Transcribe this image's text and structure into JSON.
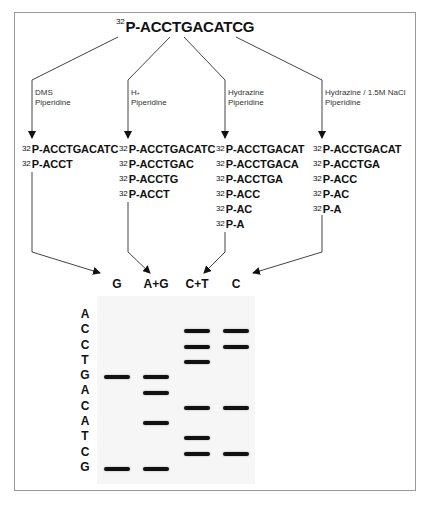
{
  "diagram": {
    "title": {
      "isotope": "32",
      "sequence": "P-ACCTGACATCG"
    },
    "reactions": [
      {
        "id": "g",
        "reagent_line1": "DMS",
        "reagent_line2": "Piperidine",
        "fragments": [
          {
            "isotope": "32",
            "seq": "P-ACCTGACATC"
          },
          {
            "isotope": "32",
            "seq": "P-ACCT"
          }
        ],
        "lane": "G"
      },
      {
        "id": "ag",
        "reagent_line1": "H",
        "reagent_line1_sup": "+",
        "reagent_line2": "Piperidine",
        "fragments": [
          {
            "isotope": "32",
            "seq": "P-ACCTGACATC"
          },
          {
            "isotope": "32",
            "seq": "P-ACCTGAC"
          },
          {
            "isotope": "32",
            "seq": "P-ACCTG"
          },
          {
            "isotope": "32",
            "seq": "P-ACCT"
          }
        ],
        "lane": "A+G"
      },
      {
        "id": "ct",
        "reagent_line1": "Hydrazine",
        "reagent_line2": "Piperidine",
        "fragments": [
          {
            "isotope": "32",
            "seq": "P-ACCTGACAT"
          },
          {
            "isotope": "32",
            "seq": "P-ACCTGACA"
          },
          {
            "isotope": "32",
            "seq": "P-ACCTGA"
          },
          {
            "isotope": "32",
            "seq": "P-ACC"
          },
          {
            "isotope": "32",
            "seq": "P-AC"
          },
          {
            "isotope": "32",
            "seq": "P-A"
          }
        ],
        "lane": "C+T"
      },
      {
        "id": "c",
        "reagent_line1": "Hydrazine / 1.5M NaCl",
        "reagent_line2": "Piperidine",
        "fragments": [
          {
            "isotope": "32",
            "seq": "P-ACCTGACAT"
          },
          {
            "isotope": "32",
            "seq": "P-ACCTGA"
          },
          {
            "isotope": "32",
            "seq": "P-ACC"
          },
          {
            "isotope": "32",
            "seq": "P-AC"
          },
          {
            "isotope": "32",
            "seq": "P-A"
          }
        ],
        "lane": "C"
      }
    ],
    "gel": {
      "lanes": [
        "G",
        "A+G",
        "C+T",
        "C"
      ],
      "read_sequence": [
        "A",
        "C",
        "C",
        "T",
        "G",
        "A",
        "C",
        "A",
        "T",
        "C",
        "G"
      ],
      "bands": {
        "G": [
          4,
          10
        ],
        "A+G": [
          4,
          5,
          7,
          10
        ],
        "C+T": [
          1,
          2,
          3,
          6,
          8,
          9
        ],
        "C": [
          1,
          2,
          6,
          9
        ]
      },
      "colors": {
        "background": "#f6f6f6",
        "band": "#111111"
      }
    }
  }
}
